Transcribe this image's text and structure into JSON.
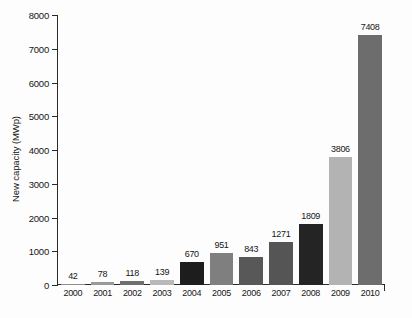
{
  "chart_data": {
    "type": "bar",
    "title": "",
    "xlabel": "",
    "ylabel": "New capacity (MWp)",
    "categories": [
      "2000",
      "2001",
      "2002",
      "2003",
      "2004",
      "2005",
      "2006",
      "2007",
      "2008",
      "2009",
      "2010"
    ],
    "values": [
      42,
      78,
      118,
      139,
      670,
      951,
      843,
      1271,
      1809,
      3806,
      7408
    ],
    "value_labels": [
      "42",
      "78",
      "118",
      "139",
      "670",
      "951",
      "843",
      "1271",
      "1809",
      "3806",
      "7408"
    ],
    "bar_colors": [
      "#8d8d8d",
      "#9a9a9a",
      "#6f6f6f",
      "#b9b9b9",
      "#1d1d1d",
      "#7f7f7f",
      "#585858",
      "#555555",
      "#242424",
      "#b3b3b3",
      "#6d6d6d"
    ],
    "ylim": [
      0,
      8000
    ],
    "ytick_labels": [
      "0",
      "1000",
      "2000",
      "3000",
      "4000",
      "5000",
      "6000",
      "7000",
      "8000"
    ],
    "ytick_values": [
      0,
      1000,
      2000,
      3000,
      4000,
      5000,
      6000,
      7000,
      8000
    ],
    "grid": false,
    "legend": null,
    "legend_position": "none",
    "background_color": "#fdfdfd",
    "axis_color": "#2a2a2a",
    "text_color": "#161616"
  }
}
